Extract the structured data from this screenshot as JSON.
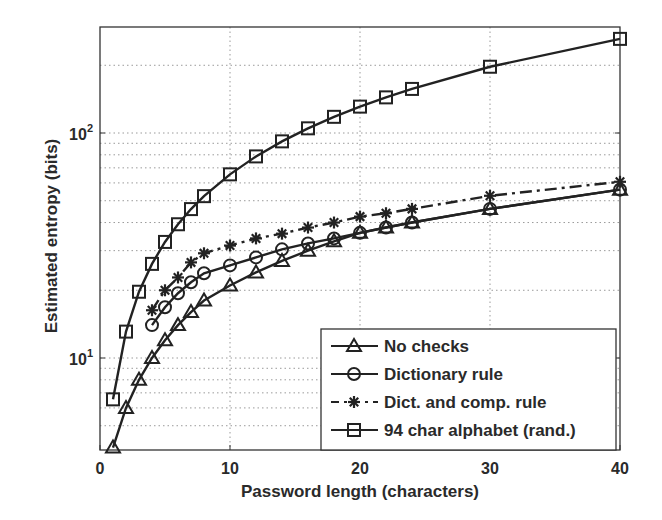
{
  "chart_data": {
    "type": "line",
    "title": "",
    "xlabel": "Password length (characters)",
    "ylabel": "Estimated entropy (bits)",
    "xlim": [
      0,
      40
    ],
    "ylim": [
      4,
      300
    ],
    "yscale": "log",
    "grid": true,
    "x_ticks": [
      0,
      10,
      20,
      30,
      40
    ],
    "y_ticks": [
      {
        "value": 10,
        "base": "10",
        "exp": "1"
      },
      {
        "value": 100,
        "base": "10",
        "exp": "2"
      }
    ],
    "legend_position": "lower right",
    "series": [
      {
        "name": "No checks",
        "marker": "triangle",
        "linestyle": "solid",
        "color": "#222222",
        "x": [
          1,
          2,
          3,
          4,
          5,
          6,
          7,
          8,
          10,
          12,
          14,
          16,
          18,
          20,
          22,
          24,
          30,
          40
        ],
        "values": [
          4,
          6,
          8,
          10,
          12,
          14,
          16,
          18,
          21,
          24,
          27,
          30,
          33,
          36,
          38,
          40,
          46,
          56
        ]
      },
      {
        "name": "Dictionary rule",
        "marker": "circle",
        "linestyle": "solid",
        "color": "#222222",
        "x": [
          4,
          5,
          6,
          7,
          8,
          10,
          12,
          14,
          16,
          18,
          20,
          22,
          24,
          30,
          40
        ],
        "values": [
          14,
          16.8,
          19.4,
          21.7,
          23.8,
          25.8,
          28,
          30.4,
          32.3,
          34,
          36,
          38,
          40,
          46,
          56
        ]
      },
      {
        "name": "Dict. and comp. rule",
        "marker": "star",
        "linestyle": "dashdot",
        "color": "#222222",
        "x": [
          4,
          5,
          6,
          7,
          8,
          10,
          12,
          14,
          16,
          18,
          20,
          22,
          24,
          30,
          40
        ],
        "values": [
          16.3,
          20,
          22.8,
          26.6,
          29.2,
          31.6,
          34,
          35.7,
          38,
          40,
          42.5,
          44,
          46,
          52.6,
          60.7
        ]
      },
      {
        "name": "94 char alphabet (rand.)",
        "marker": "square",
        "linestyle": "solid",
        "color": "#222222",
        "x": [
          1,
          2,
          3,
          4,
          5,
          6,
          7,
          8,
          10,
          12,
          14,
          16,
          18,
          20,
          22,
          24,
          30,
          40
        ],
        "values": [
          6.55,
          13.1,
          19.7,
          26.2,
          32.8,
          39.3,
          45.9,
          52.4,
          65.5,
          78.7,
          91.8,
          104.9,
          118,
          131,
          144,
          157,
          197,
          262
        ]
      }
    ]
  }
}
